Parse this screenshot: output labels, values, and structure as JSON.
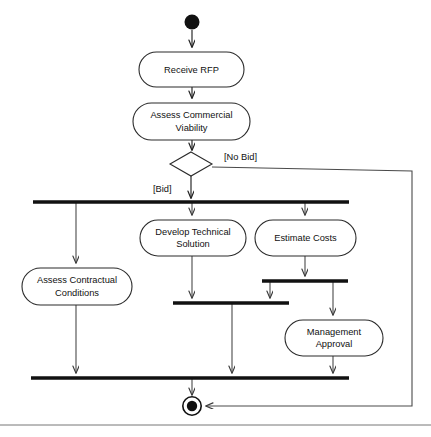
{
  "diagram": {
    "type": "uml-activity-diagram",
    "colors": {
      "background": "#ffffff",
      "node_stroke": "#2b2b2b",
      "node_fill": "#ffffff",
      "flow_stroke": "#4a4a4a",
      "bar_fill": "#111111",
      "text": "#111111"
    },
    "initial_node": {
      "name": "initial-node",
      "cx": 192,
      "cy": 22,
      "r": 7.5
    },
    "final_node": {
      "name": "final-node",
      "cx": 192,
      "cy": 406,
      "r_outer": 9.2,
      "r_inner": 5.2
    },
    "decision": {
      "name": "decision-node",
      "cx": 191,
      "cy": 164,
      "half_width": 21,
      "half_height": 12
    },
    "activities": [
      {
        "id": "receive-rfp",
        "label": "Receive RFP",
        "lines": [
          "Receive RFP"
        ],
        "x": 139,
        "y": 52,
        "width": 105,
        "height": 35
      },
      {
        "id": "assess-commercial-viability",
        "label": "Assess Commercial Viability",
        "lines": [
          "Assess Commercial",
          "Viability"
        ],
        "x": 133,
        "y": 103,
        "width": 117,
        "height": 37
      },
      {
        "id": "develop-technical-solution",
        "label": "Develop Technical Solution",
        "lines": [
          "Develop Technical",
          "Solution"
        ],
        "x": 140,
        "y": 220,
        "width": 106,
        "height": 36
      },
      {
        "id": "estimate-costs",
        "label": "Estimate Costs",
        "lines": [
          "Estimate Costs"
        ],
        "x": 255,
        "y": 220,
        "width": 101,
        "height": 36
      },
      {
        "id": "assess-contractual-conditions",
        "label": "Assess Contractual Conditions",
        "lines": [
          "Assess Contractual",
          "Conditions"
        ],
        "x": 22,
        "y": 268,
        "width": 110,
        "height": 37
      },
      {
        "id": "management-approval",
        "label": "Management Approval",
        "lines": [
          "Management",
          "Approval"
        ],
        "x": 285,
        "y": 320,
        "width": 98,
        "height": 36
      }
    ],
    "bars": [
      {
        "id": "fork-main",
        "kind": "fork",
        "x1": 33,
        "x2": 349,
        "y": 202
      },
      {
        "id": "fork-estimate-costs",
        "kind": "fork",
        "x1": 262,
        "x2": 348,
        "y": 281
      },
      {
        "id": "join-technical",
        "kind": "join",
        "x1": 173,
        "x2": 289,
        "y": 303
      },
      {
        "id": "join-final",
        "kind": "join",
        "x1": 31,
        "x2": 349,
        "y": 378
      }
    ],
    "guards": [
      {
        "id": "guard-no-bid",
        "label": "[No Bid]",
        "x": 224,
        "y": 158
      },
      {
        "id": "guard-bid",
        "label": "[Bid]",
        "x": 153,
        "y": 190
      }
    ],
    "edges": [
      {
        "id": "edge-init-to-receive",
        "from": "initial-node",
        "to": "receive-rfp"
      },
      {
        "id": "edge-receive-to-assess",
        "from": "receive-rfp",
        "to": "assess-commercial-viability"
      },
      {
        "id": "edge-assess-to-decision",
        "from": "assess-commercial-viability",
        "to": "decision-node"
      },
      {
        "id": "edge-decision-no-bid",
        "from": "decision-node",
        "to": "final-node",
        "guard": "[No Bid]"
      },
      {
        "id": "edge-decision-bid",
        "from": "decision-node",
        "to": "fork-main",
        "guard": "[Bid]"
      },
      {
        "id": "edge-fork-to-contractual",
        "from": "fork-main",
        "to": "assess-contractual-conditions"
      },
      {
        "id": "edge-fork-to-technical",
        "from": "fork-main",
        "to": "develop-technical-solution"
      },
      {
        "id": "edge-fork-to-estimate",
        "from": "fork-main",
        "to": "estimate-costs"
      },
      {
        "id": "edge-estimate-to-fork2",
        "from": "estimate-costs",
        "to": "fork-estimate-costs"
      },
      {
        "id": "edge-fork2-to-join-technical",
        "from": "fork-estimate-costs",
        "to": "join-technical"
      },
      {
        "id": "edge-fork2-to-approval",
        "from": "fork-estimate-costs",
        "to": "management-approval"
      },
      {
        "id": "edge-technical-to-join",
        "from": "develop-technical-solution",
        "to": "join-technical"
      },
      {
        "id": "edge-join-technical-to-final-join",
        "from": "join-technical",
        "to": "join-final"
      },
      {
        "id": "edge-contractual-to-final-join",
        "from": "assess-contractual-conditions",
        "to": "join-final"
      },
      {
        "id": "edge-approval-to-final-join",
        "from": "management-approval",
        "to": "join-final"
      },
      {
        "id": "edge-final-join-to-final",
        "from": "join-final",
        "to": "final-node"
      }
    ],
    "frame": {
      "id": "page-rule",
      "y": 425
    }
  }
}
